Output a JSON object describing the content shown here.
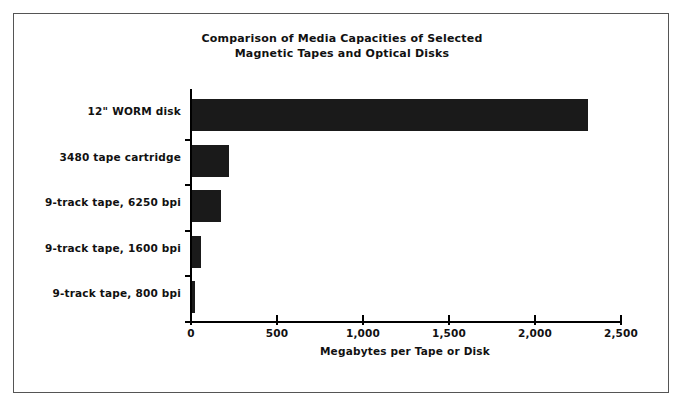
{
  "figure": {
    "background_color": "#ffffff",
    "frame_color": "#555555",
    "bar_color": "#1a1a1a"
  },
  "chart_data": {
    "type": "bar",
    "orientation": "horizontal",
    "title": "Comparison of Media Capacities of Selected\nMagnetic Tapes and Optical Disks",
    "xlabel": "Megabytes per Tape or Disk",
    "ylabel": "",
    "grid": false,
    "legend": null,
    "xlim": [
      0,
      2500
    ],
    "xticks": [
      0,
      500,
      1000,
      1500,
      2000,
      2500
    ],
    "xtick_labels": [
      "0",
      "500",
      "1,000",
      "1,500",
      "2,000",
      "2,500"
    ],
    "categories": [
      "12\" WORM disk",
      "3480 tape cartridge",
      "9-track tape, 6250 bpi",
      "9-track tape, 1600 bpi",
      "9-track tape, 800 bpi"
    ],
    "values": [
      2300,
      215,
      170,
      50,
      20
    ],
    "units": "Megabytes"
  }
}
